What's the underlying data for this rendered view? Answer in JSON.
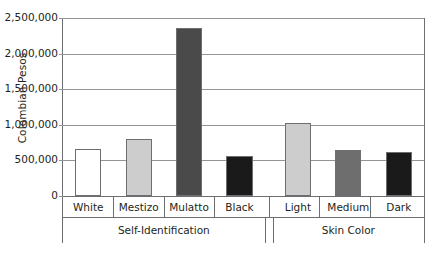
{
  "chart_data": {
    "type": "bar",
    "title": "",
    "xlabel": "",
    "ylabel": "Colombian Pesos",
    "ylim": [
      0,
      2500000
    ],
    "ytick_labels": [
      "2,500,000",
      "2,000,000",
      "1,500,000",
      "1,000,000",
      "500,000",
      "0"
    ],
    "ytick_values": [
      2500000,
      2000000,
      1500000,
      1000000,
      500000,
      0
    ],
    "grid": true,
    "legend": "none",
    "categories": [
      "White",
      "Mestizo",
      "Mulatto",
      "Black",
      "Light",
      "Medium",
      "Dark"
    ],
    "values": [
      660000,
      805000,
      2360000,
      555000,
      1030000,
      650000,
      625000
    ],
    "bar_colors": [
      "#ffffff",
      "#cdcdcd",
      "#4a4a4a",
      "#1a1a1a",
      "#cdcdcd",
      "#6e6e6e",
      "#1a1a1a"
    ],
    "groups": [
      {
        "label": "Self-Identification",
        "categories": [
          "White",
          "Mestizo",
          "Mulatto",
          "Black"
        ]
      },
      {
        "label": "Skin Color",
        "categories": [
          "Light",
          "Medium",
          "Dark"
        ]
      }
    ],
    "series": [
      {
        "name": "Colombian Pesos",
        "points": [
          {
            "category": "White",
            "group": "Self-Identification",
            "value": 660000,
            "color": "#ffffff"
          },
          {
            "category": "Mestizo",
            "group": "Self-Identification",
            "value": 805000,
            "color": "#cdcdcd"
          },
          {
            "category": "Mulatto",
            "group": "Self-Identification",
            "value": 2360000,
            "color": "#4a4a4a"
          },
          {
            "category": "Black",
            "group": "Self-Identification",
            "value": 555000,
            "color": "#1a1a1a"
          },
          {
            "category": "Light",
            "group": "Skin Color",
            "value": 1030000,
            "color": "#cdcdcd"
          },
          {
            "category": "Medium",
            "group": "Skin Color",
            "value": 650000,
            "color": "#6e6e6e"
          },
          {
            "category": "Dark",
            "group": "Skin Color",
            "value": 625000,
            "color": "#1a1a1a"
          }
        ]
      }
    ],
    "colors": {
      "axis": "#6d6e71",
      "gridline": "#929497",
      "text": "#231f20",
      "bar_border": "#6d6e71"
    }
  }
}
